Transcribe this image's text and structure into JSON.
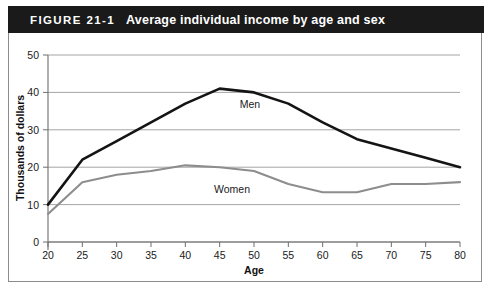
{
  "figure": {
    "number": "FIGURE 21-1",
    "title": "Average individual income by age and sex"
  },
  "chart_data": {
    "type": "line",
    "title": "Average individual income by age and sex",
    "xlabel": "Age",
    "ylabel": "Thousands of dollars",
    "x": [
      20,
      25,
      30,
      35,
      40,
      45,
      50,
      55,
      60,
      65,
      70,
      75,
      80
    ],
    "xtick_labels": [
      "20",
      "25",
      "30",
      "35",
      "40",
      "45",
      "50",
      "55",
      "60",
      "65",
      "70",
      "75",
      "80"
    ],
    "ytick_labels": [
      "0",
      "10",
      "20",
      "30",
      "40",
      "50"
    ],
    "yticks": [
      0,
      10,
      20,
      30,
      40,
      50
    ],
    "xlim": [
      20,
      80
    ],
    "ylim": [
      0,
      50
    ],
    "grid": "horizontal",
    "legend": "inline-labels",
    "series": [
      {
        "name": "Men",
        "color": "#141414",
        "values": [
          10,
          22,
          27,
          32,
          37,
          41,
          40,
          37,
          32,
          27.5,
          25,
          22.5,
          20
        ],
        "label_text": "Men"
      },
      {
        "name": "Women",
        "color": "#8d8d8d",
        "values": [
          7.5,
          16,
          18,
          19,
          20.5,
          20,
          19,
          15.5,
          13.3,
          13.3,
          15.5,
          15.5,
          16
        ],
        "label_text": "Women"
      }
    ]
  },
  "colors": {
    "title_bar_bg": "#1a1a1a",
    "title_bar_text": "#ffffff",
    "men_line": "#141414",
    "women_line": "#8d8d8d",
    "gridline": "#9a9a9a",
    "axis": "#6e6e6e",
    "frame": "#8c8c8c",
    "background": "#ffffff"
  }
}
